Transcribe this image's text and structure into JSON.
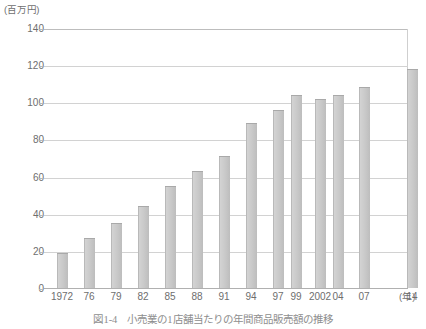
{
  "figure": {
    "caption": "図1-4　小売業の1店舗当たりの年間商品販売額の推移",
    "unit_label": "(百万円)",
    "xaxis_unit": "(年)"
  },
  "colors": {
    "bar_fill": "#c9c9c9",
    "bar_edge": "#a9a9a9",
    "gridline": "#d2d2d2",
    "text": "#6e6e6e"
  },
  "chart_data": {
    "type": "bar",
    "title": "図1-4　小売業の1店舗当たりの年間商品販売額の推移",
    "xlabel": "(年)",
    "ylabel": "(百万円)",
    "ylim": [
      0,
      140
    ],
    "yticks": [
      0,
      20,
      40,
      60,
      80,
      100,
      120,
      140
    ],
    "ytick_labels": [
      "0",
      "20",
      "40",
      "60",
      "80",
      "100",
      "120",
      "140"
    ],
    "grid": true,
    "legend": "none",
    "categories": [
      "1972",
      "76",
      "79",
      "82",
      "85",
      "88",
      "91",
      "94",
      "97",
      "99",
      "2002",
      "04",
      "07",
      "14"
    ],
    "values": [
      19,
      27,
      35,
      44,
      55,
      63,
      71,
      89,
      96,
      104,
      102,
      104,
      108,
      118
    ]
  }
}
